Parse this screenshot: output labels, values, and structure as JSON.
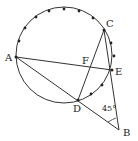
{
  "diagram": {
    "type": "geometry",
    "circle": {
      "cx": 64,
      "cy": 55,
      "r": 48
    },
    "points": {
      "A": {
        "label": "A",
        "x": 16,
        "y": 57,
        "lx": 5,
        "ly": 61
      },
      "C": {
        "label": "C",
        "x": 104,
        "y": 30,
        "lx": 106,
        "ly": 27
      },
      "E": {
        "label": "E",
        "x": 112,
        "y": 70,
        "lx": 115,
        "ly": 75
      },
      "F": {
        "label": "F",
        "x": 91,
        "y": 66,
        "lx": 82,
        "ly": 64
      },
      "D": {
        "label": "D",
        "x": 78,
        "y": 100,
        "lx": 73,
        "ly": 112
      },
      "B": {
        "label": "B",
        "x": 119,
        "y": 130,
        "lx": 123,
        "ly": 136
      }
    },
    "angle_label": {
      "text": "45°",
      "x": 102,
      "y": 111
    },
    "arc_dots": [
      [
        19,
        41
      ],
      [
        25,
        28
      ],
      [
        36,
        17
      ],
      [
        49,
        11
      ],
      [
        64,
        9
      ],
      [
        79,
        11
      ],
      [
        93,
        18
      ],
      [
        111,
        43
      ],
      [
        114,
        56
      ],
      [
        102,
        85
      ],
      [
        91,
        94
      ]
    ]
  }
}
